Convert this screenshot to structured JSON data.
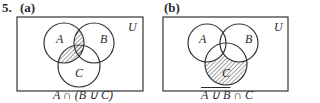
{
  "problem_number": "5.",
  "panels": [
    {
      "label": "(a)",
      "universe_label": "U",
      "set_labels": {
        "a": "A",
        "b": "B",
        "c": "C"
      },
      "caption": "A ∩ (B ∪ C)",
      "shaded_region": "A ∩ (B ∪ C)"
    },
    {
      "label": "(b)",
      "universe_label": "U",
      "set_labels": {
        "a": "A",
        "b": "B",
        "c": "C"
      },
      "caption_overlined": "A ∪ B",
      "caption_rest": " ∩ C",
      "shaded_region": "complement(A ∪ B) ∩ C"
    }
  ],
  "colors": {
    "line": "#333333",
    "hatch": "#444444",
    "background": "#ffffff"
  }
}
